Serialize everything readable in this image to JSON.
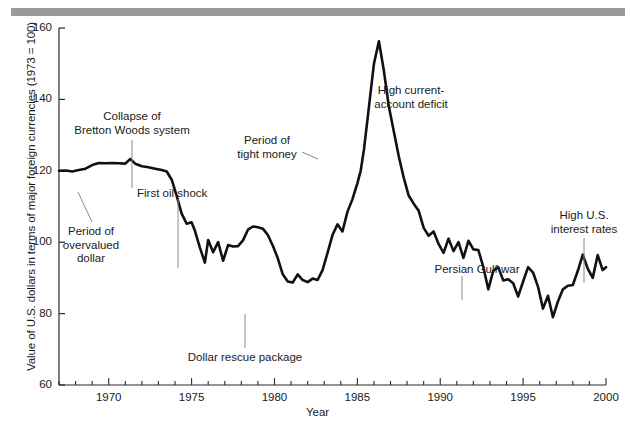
{
  "figure": {
    "background_color": "#ffffff",
    "line_color": "#111111",
    "rule_color": "#9a9a9a",
    "leader_color": "#8a8a8a"
  },
  "chart_data": {
    "type": "line",
    "title": "",
    "xlabel": "Year",
    "ylabel": "Value of U.S. dollars in terms of major foreign currencies (1973 = 100)",
    "xlim": [
      1967,
      2000
    ],
    "ylim": [
      60,
      160
    ],
    "xticks": [
      1970,
      1975,
      1980,
      1985,
      1990,
      1995,
      2000
    ],
    "xtick_labels": [
      "1970",
      "1975",
      "1980",
      "1985",
      "1990",
      "1995",
      "2000"
    ],
    "yticks": [
      60,
      80,
      100,
      120,
      140,
      160
    ],
    "ytick_labels": [
      "60",
      "80",
      "100",
      "120",
      "140",
      "160"
    ],
    "minor_xtick_interval": 1,
    "grid": false,
    "legend": false,
    "series": [
      {
        "name": "U.S. dollar index (1973 = 100)",
        "x": [
          1967.0,
          1967.4,
          1967.8,
          1968.2,
          1968.6,
          1969.0,
          1969.4,
          1969.8,
          1970.2,
          1970.6,
          1971.0,
          1971.3,
          1971.6,
          1972.0,
          1972.4,
          1972.8,
          1973.2,
          1973.5,
          1973.8,
          1974.1,
          1974.4,
          1974.7,
          1975.0,
          1975.2,
          1975.5,
          1975.8,
          1976.0,
          1976.3,
          1976.6,
          1976.9,
          1977.2,
          1977.5,
          1977.8,
          1978.1,
          1978.4,
          1978.7,
          1979.0,
          1979.3,
          1979.6,
          1979.9,
          1980.2,
          1980.5,
          1980.8,
          1981.1,
          1981.4,
          1981.7,
          1982.0,
          1982.3,
          1982.6,
          1982.9,
          1983.2,
          1983.5,
          1983.8,
          1984.1,
          1984.4,
          1984.7,
          1985.0,
          1985.2,
          1985.4,
          1985.7,
          1986.0,
          1986.3,
          1986.6,
          1986.9,
          1987.2,
          1987.5,
          1987.8,
          1988.1,
          1988.4,
          1988.7,
          1989.0,
          1989.3,
          1989.6,
          1989.9,
          1990.2,
          1990.5,
          1990.8,
          1991.1,
          1991.4,
          1991.7,
          1992.0,
          1992.3,
          1992.6,
          1992.9,
          1993.2,
          1993.5,
          1993.8,
          1994.1,
          1994.4,
          1994.7,
          1995.0,
          1995.3,
          1995.6,
          1995.9,
          1996.2,
          1996.5,
          1996.8,
          1997.1,
          1997.4,
          1997.7,
          1998.0,
          1998.3,
          1998.6,
          1998.9,
          1999.2,
          1999.5,
          1999.8,
          2000.0
        ],
        "y": [
          120.0,
          120.1,
          119.8,
          120.2,
          120.6,
          121.6,
          122.2,
          122.1,
          122.2,
          122.1,
          122.0,
          123.3,
          122.0,
          121.3,
          121.0,
          120.6,
          120.2,
          119.8,
          117.5,
          113.0,
          108.0,
          105.2,
          105.6,
          103.2,
          98.5,
          94.3,
          100.6,
          97.2,
          100.0,
          94.8,
          99.2,
          98.8,
          98.9,
          100.5,
          103.5,
          104.4,
          104.2,
          103.8,
          102.0,
          99.0,
          95.5,
          91.0,
          89.0,
          88.7,
          91.0,
          89.4,
          88.8,
          89.8,
          89.4,
          92.2,
          97.0,
          102.0,
          105.0,
          103.0,
          108.5,
          112.0,
          116.5,
          120.0,
          126.0,
          138.0,
          150.0,
          156.3,
          148.0,
          138.0,
          131.0,
          124.0,
          118.0,
          113.0,
          110.8,
          108.8,
          104.0,
          101.8,
          103.0,
          99.5,
          97.0,
          101.0,
          97.5,
          100.0,
          95.6,
          100.4,
          98.0,
          97.8,
          93.0,
          86.8,
          92.0,
          93.0,
          89.3,
          89.6,
          88.5,
          84.8,
          89.0,
          93.0,
          91.5,
          87.5,
          81.4,
          85.0,
          79.0,
          83.4,
          86.8,
          87.8,
          88.0,
          92.0,
          96.5,
          92.6,
          90.0,
          96.4,
          92.2,
          93.0
        ]
      }
    ],
    "annotations": [
      {
        "id": "collapse-bretton-woods",
        "text": "Collapse of\nBretton Woods system",
        "align": "center",
        "label_x_px": 132,
        "label_y_px": 110,
        "leader": {
          "x1": 132,
          "y1": 140,
          "x2": 132,
          "y2": 188
        },
        "points_to_year": 1971.5
      },
      {
        "id": "period-of-overvalued-dollar",
        "text": "Period of\novervalued\ndollar",
        "align": "center",
        "label_x_px": 91,
        "label_y_px": 225,
        "leader": {
          "x1": 92,
          "y1": 222,
          "x2": 78,
          "y2": 192
        },
        "points_to_year": 1969.5
      },
      {
        "id": "first-oil-shock",
        "text": "First oil shock",
        "align": "left",
        "label_x_px": 137,
        "label_y_px": 187,
        "leader": {
          "x1": 178,
          "y1": 199,
          "x2": 178,
          "y2": 268
        },
        "points_to_year": 1974.4
      },
      {
        "id": "period-of-tight-money",
        "text": "Period of\ntight money",
        "align": "center",
        "label_x_px": 267,
        "label_y_px": 134,
        "leader": {
          "x1": 302,
          "y1": 152,
          "x2": 318,
          "y2": 159
        },
        "points_to_year": 1981.8
      },
      {
        "id": "dollar-rescue-package",
        "text": "Dollar rescue package",
        "align": "center",
        "label_x_px": 245,
        "label_y_px": 351,
        "leader": {
          "x1": 245,
          "y1": 348,
          "x2": 245,
          "y2": 314
        },
        "points_to_year": 1979.2
      },
      {
        "id": "high-current-account-deficit",
        "text": "High current-\naccount deficit",
        "align": "center",
        "label_x_px": 411,
        "label_y_px": 84,
        "leader": null,
        "points_to_year": 1985.6
      },
      {
        "id": "persian-gulf-war",
        "text": "Persian Gulf war",
        "align": "center",
        "label_x_px": 477,
        "label_y_px": 263,
        "leader": {
          "x1": 462,
          "y1": 276,
          "x2": 462,
          "y2": 300
        },
        "points_to_year": 1991.3
      },
      {
        "id": "high-us-interest-rates",
        "text": "High U.S.\ninterest rates",
        "align": "center",
        "label_x_px": 584,
        "label_y_px": 209,
        "leader": {
          "x1": 584,
          "y1": 238,
          "x2": 584,
          "y2": 283
        },
        "points_to_year": 1998.6
      }
    ]
  }
}
